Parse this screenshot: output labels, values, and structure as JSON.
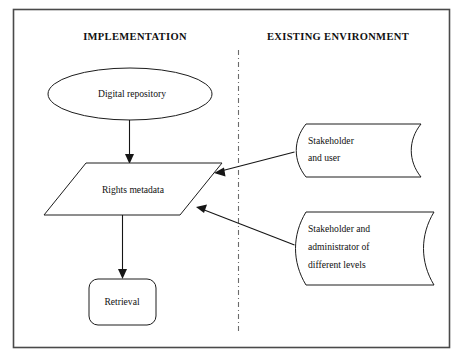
{
  "diagram": {
    "columns": [
      {
        "id": "implementation",
        "label": "IMPLEMENTATION"
      },
      {
        "id": "existing-environment",
        "label": "EXISTING ENVIRONMENT"
      }
    ],
    "divider": {
      "style": "dash-dot",
      "orientation": "vertical",
      "color": "#6b6b6b"
    },
    "colors": {
      "frame_border": "#4a4a4a",
      "shape_outline": "#1c1c1c",
      "shape_fill": "#ffffff",
      "connector": "#151515",
      "text": "#101010",
      "background": "#ffffff"
    },
    "nodes": [
      {
        "id": "digital-repository",
        "shape": "ellipse",
        "column": "implementation",
        "label": "Digital repository",
        "lines": [
          "Digital repository"
        ]
      },
      {
        "id": "rights-metadata",
        "shape": "parallelogram",
        "column": "implementation",
        "label": "Rights metadata",
        "lines": [
          "Rights metadata"
        ]
      },
      {
        "id": "retrieval",
        "shape": "rounded-rectangle",
        "column": "implementation",
        "label": "Retrieval",
        "lines": [
          "Retrieval"
        ]
      },
      {
        "id": "stakeholder-and-user",
        "shape": "tape",
        "column": "existing-environment",
        "label": "Stakeholder and user",
        "lines": [
          "Stakeholder",
          "and user"
        ]
      },
      {
        "id": "stakeholder-and-administrator",
        "shape": "tape",
        "column": "existing-environment",
        "label": "Stakeholder and administrator of different levels",
        "lines": [
          "Stakeholder and",
          "administrator of",
          "different levels"
        ]
      }
    ],
    "edges": [
      {
        "id": "edge-repository-to-metadata",
        "from": "digital-repository",
        "to": "rights-metadata",
        "arrow": "end",
        "direction": "down"
      },
      {
        "id": "edge-metadata-to-retrieval",
        "from": "rights-metadata",
        "to": "retrieval",
        "arrow": "end",
        "direction": "down"
      },
      {
        "id": "edge-user-to-metadata",
        "from": "stakeholder-and-user",
        "to": "rights-metadata",
        "arrow": "end",
        "direction": "left"
      },
      {
        "id": "edge-administrator-to-metadata",
        "from": "stakeholder-and-administrator",
        "to": "rights-metadata",
        "arrow": "end",
        "direction": "left"
      }
    ]
  }
}
